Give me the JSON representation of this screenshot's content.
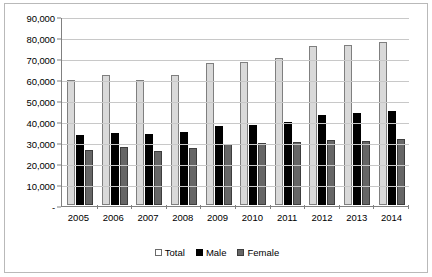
{
  "chart_data": {
    "type": "bar",
    "title": "",
    "xlabel": "",
    "ylabel": "",
    "categories": [
      "2005",
      "2006",
      "2007",
      "2008",
      "2009",
      "2010",
      "2011",
      "2012",
      "2013",
      "2014"
    ],
    "series": [
      {
        "name": "Total",
        "color": "#d9d9d9",
        "values": [
          59500,
          61800,
          59700,
          61800,
          67500,
          68300,
          70200,
          75500,
          76200,
          77500
        ]
      },
      {
        "name": "Male",
        "color": "#000000",
        "values": [
          33500,
          34200,
          33700,
          34600,
          37800,
          38300,
          39400,
          43000,
          43600,
          44700
        ]
      },
      {
        "name": "Female",
        "color": "#666666",
        "values": [
          26000,
          27600,
          25800,
          27300,
          29200,
          29300,
          29800,
          31000,
          30600,
          31200
        ]
      }
    ],
    "ylim": [
      0,
      90000
    ],
    "yticks": [
      0,
      10000,
      20000,
      30000,
      40000,
      50000,
      60000,
      70000,
      80000,
      90000
    ],
    "ytick_labels": [
      "-",
      "10,000",
      "20,000",
      "30,000",
      "40,000",
      "50,000",
      "60,000",
      "70,000",
      "80,000",
      "90,000"
    ],
    "grid": true,
    "legend_position": "bottom"
  },
  "legend": {
    "items": [
      {
        "label": "Total",
        "swatch": "total"
      },
      {
        "label": "Male",
        "swatch": "male"
      },
      {
        "label": "Female",
        "swatch": "female"
      }
    ]
  }
}
